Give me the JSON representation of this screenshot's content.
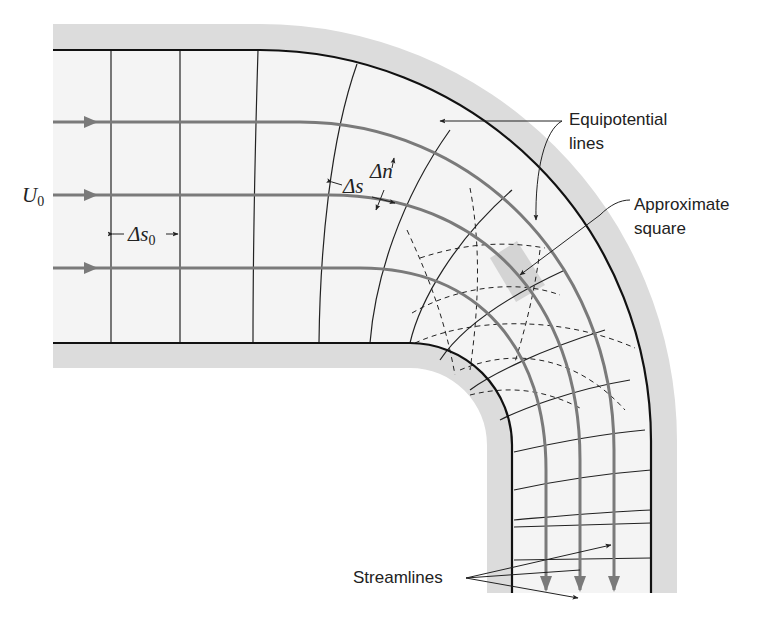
{
  "figure": {
    "colors": {
      "wall_band": "#dcdcdc",
      "channel_fill": "#f4f4f4",
      "wall_line": "#111111",
      "streamline": "#7a7a7a",
      "equipotential": "#222222",
      "highlight_square": "#d6d6d6"
    }
  },
  "labels": {
    "inlet_velocity": {
      "symbol": "U",
      "subscript": "0"
    },
    "delta_s0": {
      "symbol": "Δs",
      "subscript": "0"
    },
    "delta_s": {
      "symbol": "Δs"
    },
    "delta_n": {
      "symbol": "Δn"
    },
    "equipotential": {
      "line1": "Equipotential",
      "line2": "lines"
    },
    "approx_square": {
      "line1": "Approximate",
      "line2": "square"
    },
    "streamlines": {
      "text": "Streamlines"
    }
  },
  "geometry": {
    "streamline_count": 3,
    "straight_equipotential_count": 3,
    "flow_direction": "left-to-right, turning downward"
  }
}
